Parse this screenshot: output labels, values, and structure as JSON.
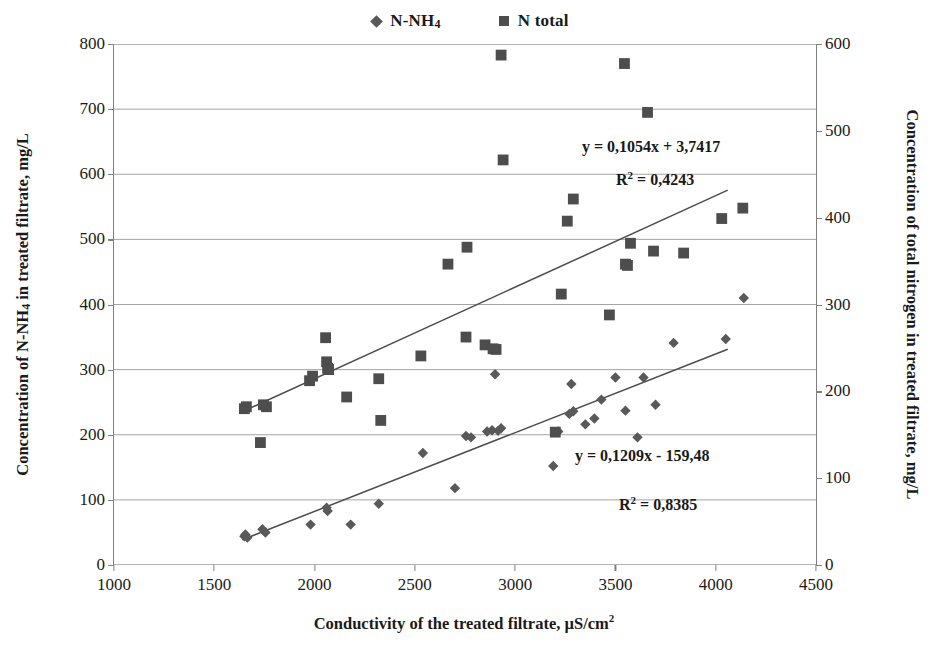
{
  "legend": {
    "position": "top-center",
    "entries": [
      {
        "label_html": "N-NH",
        "label_sub": "4",
        "label": "N-NH4",
        "marker": "diamond",
        "color": "#595959"
      },
      {
        "label": "N total",
        "marker": "square",
        "color": "#4d4d4d"
      }
    ]
  },
  "axes": {
    "x_title_main": "Conductivity of the treated filtrate, µS/cm",
    "x_title_sup": "2",
    "y_left_title_a": "Concentration of N-NH",
    "y_left_title_sub": "4",
    "y_left_title_b": " in treated filtrate, mg/L",
    "y_right_title": "Concentration of total nitrogen in treated filtrate, mg/L"
  },
  "annotations": {
    "eq_total_nitrogen": "y = 0,1054x + 3,7417",
    "r2_total_nitrogen_pre": "R",
    "r2_total_nitrogen_sup": "2",
    "r2_total_nitrogen_val": " = 0,4243",
    "eq_ammonium": "y = 0,1209x - 159,48",
    "r2_ammonium_pre": "R",
    "r2_ammonium_sup": "2",
    "r2_ammonium_val": " = 0,8385"
  },
  "chart_data": {
    "type": "scatter",
    "title": "",
    "xlabel": "Conductivity of the treated filtrate, µS/cm2",
    "ylabel": "Concentration of N-NH4 in treated filtrate, mg/L",
    "y2label": "Concentration of total nitrogen in treated filtrate, mg/L",
    "xlim": [
      1000,
      4500
    ],
    "xticks": [
      1000,
      1500,
      2000,
      2500,
      3000,
      3500,
      4000,
      4500
    ],
    "ylim": [
      0,
      800
    ],
    "yticks": [
      0,
      100,
      200,
      300,
      400,
      500,
      600,
      700,
      800
    ],
    "y2lim": [
      0,
      600
    ],
    "y2ticks": [
      0,
      100,
      200,
      300,
      400,
      500,
      600
    ],
    "grid": "horizontal",
    "legend_position": "top-center",
    "series": [
      {
        "name": "N-NH4",
        "marker": "diamond",
        "color": "#595959",
        "axis": "left",
        "points": [
          [
            1650,
            44
          ],
          [
            1655,
            47
          ],
          [
            1665,
            42
          ],
          [
            1740,
            55
          ],
          [
            1755,
            50
          ],
          [
            1980,
            62
          ],
          [
            2060,
            88
          ],
          [
            2065,
            83
          ],
          [
            2180,
            62
          ],
          [
            2320,
            94
          ],
          [
            2540,
            172
          ],
          [
            2700,
            118
          ],
          [
            2755,
            198
          ],
          [
            2780,
            196
          ],
          [
            2860,
            205
          ],
          [
            2885,
            207
          ],
          [
            2900,
            293
          ],
          [
            2915,
            206
          ],
          [
            2930,
            210
          ],
          [
            3190,
            152
          ],
          [
            3215,
            205
          ],
          [
            3270,
            232
          ],
          [
            3280,
            278
          ],
          [
            3290,
            236
          ],
          [
            3350,
            216
          ],
          [
            3395,
            225
          ],
          [
            3430,
            254
          ],
          [
            3500,
            288
          ],
          [
            3550,
            237
          ],
          [
            3610,
            196
          ],
          [
            3640,
            288
          ],
          [
            3700,
            246
          ],
          [
            3790,
            341
          ],
          [
            4050,
            347
          ],
          [
            4140,
            410
          ]
        ]
      },
      {
        "name": "N total",
        "marker": "square",
        "color": "#4d4d4d",
        "axis": "right",
        "points_left_scale": [
          [
            1650,
            240
          ],
          [
            1660,
            243
          ],
          [
            1730,
            188
          ],
          [
            1745,
            246
          ],
          [
            1760,
            243
          ],
          [
            1975,
            283
          ],
          [
            1990,
            290
          ],
          [
            2055,
            349
          ],
          [
            2060,
            312
          ],
          [
            2065,
            302
          ],
          [
            2070,
            300
          ],
          [
            2160,
            258
          ],
          [
            2320,
            286
          ],
          [
            2330,
            222
          ],
          [
            2530,
            321
          ],
          [
            2665,
            462
          ],
          [
            2755,
            350
          ],
          [
            2760,
            488
          ],
          [
            2850,
            338
          ],
          [
            2890,
            332
          ],
          [
            2905,
            331
          ],
          [
            2930,
            783
          ],
          [
            2940,
            622
          ],
          [
            3200,
            204
          ],
          [
            3230,
            416
          ],
          [
            3260,
            528
          ],
          [
            3290,
            562
          ],
          [
            3470,
            384
          ],
          [
            3545,
            770
          ],
          [
            3550,
            462
          ],
          [
            3560,
            460
          ],
          [
            3575,
            494
          ],
          [
            3660,
            695
          ],
          [
            3690,
            482
          ],
          [
            3840,
            479
          ],
          [
            4030,
            532
          ],
          [
            4135,
            548
          ]
        ]
      }
    ],
    "trendlines": [
      {
        "name": "N total trendline",
        "equation": "y = 0,1054x + 3,7417",
        "slope": 0.1054,
        "intercept": 3.7417,
        "r2": 0.4243,
        "axis": "right",
        "x_from": 1640,
        "x_to": 4060
      },
      {
        "name": "N-NH4 trendline",
        "equation": "y = 0,1209x - 159,48",
        "slope": 0.1209,
        "intercept": -159.48,
        "r2": 0.8385,
        "axis": "left",
        "x_from": 1640,
        "x_to": 4060
      }
    ]
  }
}
